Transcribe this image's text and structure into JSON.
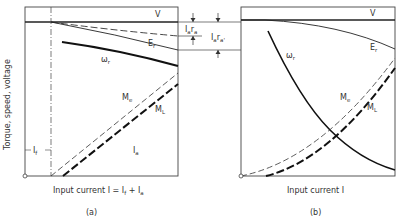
{
  "diagram": {
    "y_axis_label": "Torque, speed, voltage",
    "panel_a": {
      "caption": "(a)",
      "x_label": "Input current I = I",
      "x_label_f": "f",
      "x_label_plus": " + I",
      "x_label_a": "a",
      "curves": {
        "V": "V",
        "Er": "E",
        "Er_sub": "r",
        "wr": "ω",
        "wr_sub": "r",
        "Me": "M",
        "Me_sub": "e",
        "Ml": "M",
        "Ml_sub": "L"
      },
      "region_labels": {
        "If": "I",
        "If_sub": "f",
        "Ia": "I",
        "Ia_sub": "a"
      }
    },
    "annotations": {
      "Iara": "I",
      "Iara_sub1": "a",
      "Iara_r": "r",
      "Iara_sub2": "a",
      "Iara2": "I",
      "Iara2_sub1": "a",
      "Iara2_r": "r",
      "Iara2_sub2": "a'"
    },
    "panel_b": {
      "caption": "(b)",
      "x_label": "Input current I",
      "curves": {
        "V": "V",
        "Er": "E",
        "Er_sub": "r",
        "wr": "ω",
        "wr_sub": "r",
        "Me": "M",
        "Me_sub": "e",
        "Ml": "M",
        "Ml_sub": "L"
      }
    }
  }
}
